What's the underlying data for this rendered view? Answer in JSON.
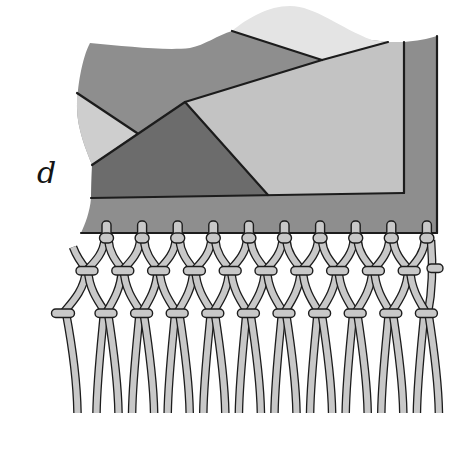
{
  "figure": {
    "label": "d"
  },
  "colors": {
    "background": "#ffffff",
    "fabric_medium": "#8e8e8e",
    "fabric_light": "#c3c3c3",
    "fabric_left": "#cecece",
    "fabric_top": "#e4e4e4",
    "fabric_dark": "#6c6c6c",
    "outline": "#1c1c1c",
    "cord": "#c8c8c8",
    "label": "#141414"
  },
  "fringe": {
    "peg_count": 10,
    "middle_knot_count": 10,
    "edge_knot_count": 1,
    "bottom_knot_count": 11,
    "cord_end_count": 21
  }
}
